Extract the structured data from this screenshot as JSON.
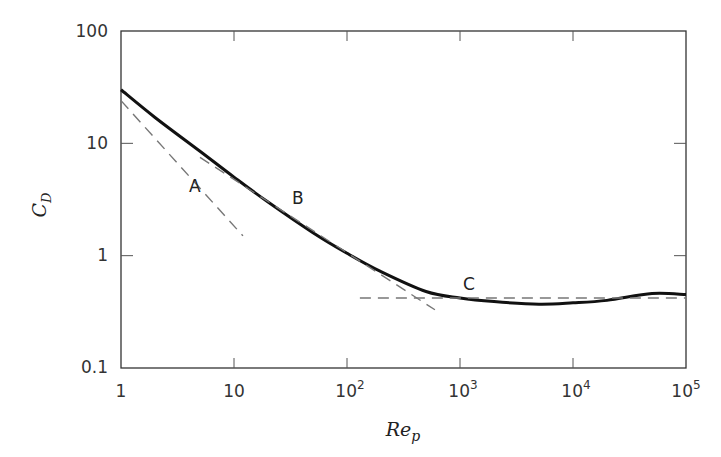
{
  "chart_data": {
    "type": "line",
    "title": "",
    "xlabel": "Re_p",
    "ylabel": "C_D",
    "xscale": "log",
    "yscale": "log",
    "xlim": [
      1,
      100000
    ],
    "ylim": [
      0.1,
      100
    ],
    "x_ticks": [
      "1",
      "10",
      "10^2",
      "10^3",
      "10^4",
      "10^5"
    ],
    "y_ticks": [
      "0.1",
      "1",
      "10",
      "100"
    ],
    "grid": false,
    "legend": null,
    "series": [
      {
        "name": "C_D curve",
        "style": "solid-thick",
        "x": [
          1,
          2,
          5,
          10,
          20,
          50,
          100,
          200,
          500,
          1000,
          2000,
          5000,
          10000,
          20000,
          50000,
          100000
        ],
        "y": [
          30,
          17,
          8.5,
          5.0,
          3.0,
          1.6,
          1.05,
          0.72,
          0.48,
          0.42,
          0.39,
          0.37,
          0.38,
          0.4,
          0.46,
          0.45
        ]
      },
      {
        "name": "A",
        "style": "dashed",
        "x": [
          1,
          12
        ],
        "y": [
          24,
          1.5
        ]
      },
      {
        "name": "B",
        "style": "dashed",
        "x": [
          5,
          600
        ],
        "y": [
          7.5,
          0.33
        ]
      },
      {
        "name": "C",
        "style": "dashed",
        "x": [
          130,
          100000
        ],
        "y": [
          0.42,
          0.42
        ]
      }
    ],
    "annotations": [
      {
        "text": "A",
        "x": 7.5,
        "y": 2.3
      },
      {
        "text": "B",
        "x": 45,
        "y": 5.0
      },
      {
        "text": "C",
        "x": 1000,
        "y": 0.55
      }
    ]
  },
  "labels": {
    "x_axis": "Re",
    "x_axis_sub": "p",
    "y_axis": "C",
    "y_axis_sub": "D",
    "x_ticks": [
      {
        "base": "1",
        "exp": ""
      },
      {
        "base": "10",
        "exp": ""
      },
      {
        "base": "10",
        "exp": "2"
      },
      {
        "base": "10",
        "exp": "3"
      },
      {
        "base": "10",
        "exp": "4"
      },
      {
        "base": "10",
        "exp": "5"
      }
    ],
    "y_ticks": [
      "0.1",
      "1",
      "10",
      "100"
    ],
    "ann_a": "A",
    "ann_b": "B",
    "ann_c": "C"
  }
}
